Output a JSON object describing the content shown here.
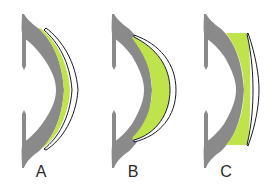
{
  "diagram": {
    "colors": {
      "cornea": "#8a8a8a",
      "tear_film": "#bfe34a",
      "lens_fill": "#ffffff",
      "lens_outline": "#1a1a2a",
      "label": "#2a2a2a",
      "background": "#ffffff"
    },
    "panels": [
      {
        "id": "A",
        "label": "A",
        "description": "Thin uniform fluorescein layer under lens (alignment fit)"
      },
      {
        "id": "B",
        "label": "B",
        "description": "Central fluorescein pooling under steep lens"
      },
      {
        "id": "C",
        "label": "C",
        "description": "Peripheral pooling under flat lens"
      }
    ]
  }
}
